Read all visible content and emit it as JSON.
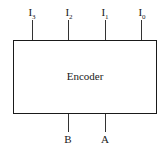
{
  "block": {
    "title": "Encoder"
  },
  "inputs": [
    {
      "label": "I",
      "sub": "3"
    },
    {
      "label": "I",
      "sub": "2"
    },
    {
      "label": "I",
      "sub": "1"
    },
    {
      "label": "I",
      "sub": "0"
    }
  ],
  "outputs": [
    {
      "label": "B"
    },
    {
      "label": "A"
    }
  ]
}
